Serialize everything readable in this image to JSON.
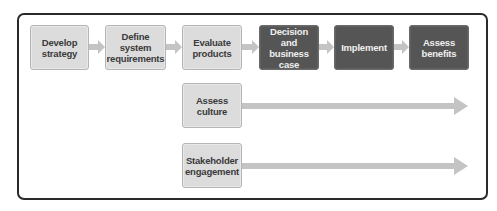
{
  "diagram": {
    "process_steps": [
      {
        "label": "Develop strategy",
        "style": "light"
      },
      {
        "label": "Define system requirements",
        "style": "light"
      },
      {
        "label": "Evaluate products",
        "style": "light"
      },
      {
        "label": "Decision and business case",
        "style": "dark"
      },
      {
        "label": "Implement",
        "style": "dark"
      },
      {
        "label": "Assess benefits",
        "style": "dark"
      }
    ],
    "parallel_activities": [
      {
        "label": "Assess culture"
      },
      {
        "label": "Stakeholder engagement"
      }
    ],
    "colors": {
      "light_box": "#dcdcdc",
      "dark_box": "#555555",
      "arrow": "#c4c4c4",
      "frame": "#2a2a2a"
    }
  }
}
